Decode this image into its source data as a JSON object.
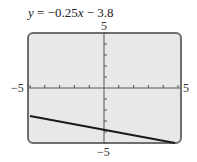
{
  "chart_data": {
    "type": "line",
    "title": "y = −0.25x − 3.8",
    "equation": {
      "slope": -0.25,
      "intercept": -3.8
    },
    "xlabel": "",
    "ylabel": "",
    "xlim": [
      -5,
      5
    ],
    "ylim": [
      -5,
      5
    ],
    "x_tick_labels": {
      "min": "−5",
      "max": "5"
    },
    "y_tick_labels": {
      "min": "−5",
      "max": "5"
    },
    "x_tick_step": 1,
    "y_tick_step": 1,
    "grid": false,
    "series": [
      {
        "name": "y = −0.25x − 3.8",
        "x": [
          -5,
          4.8
        ],
        "y": [
          -2.55,
          -5.0
        ]
      }
    ],
    "colors": {
      "background": "#e8e8e8",
      "frame": "#6e6e6e",
      "line": "#1a1a1a",
      "axes": "#555555"
    }
  },
  "labels": {
    "title_prefix": "y",
    "title_rest": " = −0.25",
    "title_x": "x",
    "title_suffix": " − 3.8",
    "y_max": "5",
    "y_min": "−5",
    "x_min": "−5",
    "x_max": "5"
  }
}
